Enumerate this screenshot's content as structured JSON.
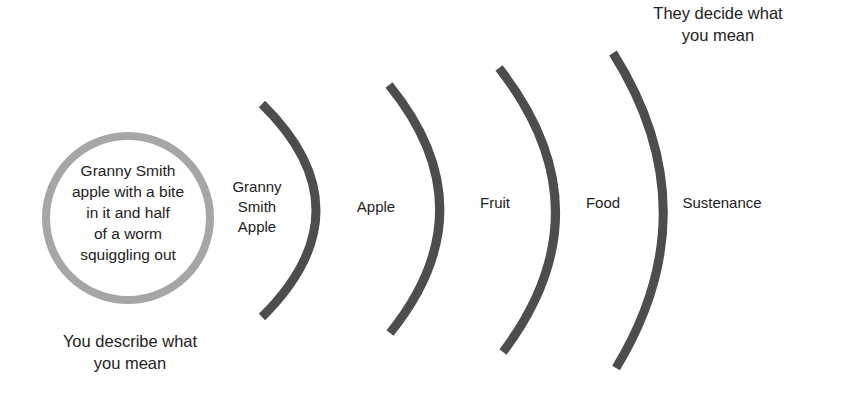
{
  "diagram": {
    "type": "concentric-abstraction",
    "colors": {
      "arc": "#4d4d4d",
      "circle": "#a6a6a6",
      "text": "#222222",
      "background": "#ffffff"
    },
    "center_circle": {
      "lines": [
        "Granny Smith",
        "apple with a bite",
        "in it and half",
        "of a worm",
        "squiggling out"
      ]
    },
    "levels": [
      {
        "lines": [
          "Granny",
          "Smith",
          "Apple"
        ]
      },
      {
        "label": "Apple"
      },
      {
        "label": "Fruit"
      },
      {
        "label": "Food"
      },
      {
        "label": "Sustenance"
      }
    ],
    "captions": {
      "bottom_left": [
        "You describe what",
        "you mean"
      ],
      "top_right": [
        "They decide what",
        "you mean"
      ]
    }
  }
}
